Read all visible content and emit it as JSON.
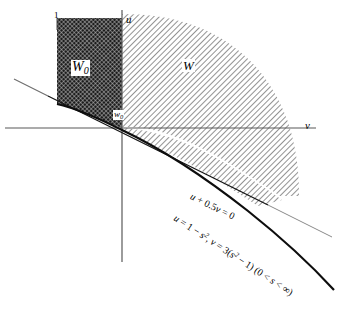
{
  "figure": {
    "kind": "mathematical-region-diagram",
    "background_color": "#ffffff",
    "ink_color": "#000000",
    "axes": {
      "horizontal_label": "v",
      "vertical_label": "u",
      "origin_px": [
        122,
        128
      ],
      "tick_label_top_left": "1"
    },
    "regions": [
      {
        "name": "W0",
        "label": "W",
        "label_subscript": "0",
        "fill_style": "dense-crosshatch",
        "fill_color": "#2b2b2b",
        "label_pos_px": [
          80,
          68
        ]
      },
      {
        "name": "W",
        "label": "W",
        "label_subscript": "",
        "fill_style": "diagonal-hatch",
        "fill_color": "#9a9a9a",
        "label_pos_px": [
          186,
          66
        ]
      }
    ],
    "points": [
      {
        "name": "w0",
        "label": "w",
        "label_subscript": "0",
        "pos_px": [
          118,
          113
        ]
      }
    ],
    "curves": [
      {
        "name": "line-u-plus-half-v",
        "equation_parts": [
          "u",
          " + 0.5",
          "v",
          " = 0"
        ],
        "equation_text": "u + 0.5v = 0",
        "style": "solid-thin",
        "rotation_deg": 26,
        "label_pos_px": [
          196,
          196
        ]
      },
      {
        "name": "cusp-curve-parametric",
        "equation_parts": [
          "u",
          " = 1 − ",
          "s",
          "2",
          ", ",
          "v",
          " = 3(",
          "s",
          "2",
          " − 1) (0 < ",
          "s",
          " < ∞)"
        ],
        "equation_text": "u = 1 − s², v = 3(s² − 1) (0 < s < ∞)",
        "style": "solid-thick",
        "rotation_deg": 33,
        "label_pos_px": [
          182,
          216
        ]
      }
    ]
  }
}
